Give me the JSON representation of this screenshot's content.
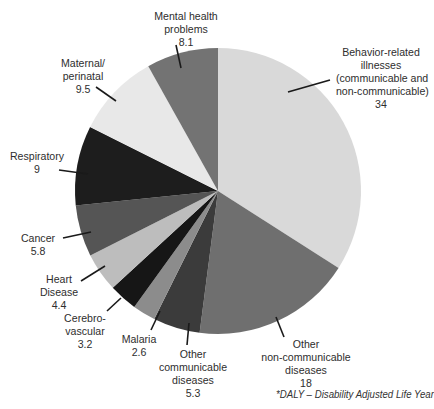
{
  "chart_data": {
    "type": "pie",
    "title": "",
    "unit": "DALY",
    "start_angle_deg": 0,
    "direction": "clockwise",
    "slices": [
      {
        "label": "Behavior-related illnesses (communicable and non-communicable)",
        "value": 34,
        "color": "#d9d9d9"
      },
      {
        "label": "Other non-communicable diseases",
        "value": 18,
        "color": "#6f6f6f"
      },
      {
        "label": "Other communicable diseases",
        "value": 5.3,
        "color": "#3b3b3b"
      },
      {
        "label": "Malaria",
        "value": 2.6,
        "color": "#8c8c8c"
      },
      {
        "label": "Cerebro-vascular",
        "value": 3.2,
        "color": "#161616"
      },
      {
        "label": "Heart Disease",
        "value": 4.4,
        "color": "#bdbdbd"
      },
      {
        "label": "Cancer",
        "value": 5.8,
        "color": "#555555"
      },
      {
        "label": "Respiratory",
        "value": 9,
        "color": "#1d1d1d"
      },
      {
        "label": "Maternal/perinatal",
        "value": 9.5,
        "color": "#e8e8e8"
      },
      {
        "label": "Mental health problems",
        "value": 8.1,
        "color": "#737373"
      }
    ],
    "footnote": "*DALY – Disability Adjusted Life Year"
  },
  "labels": {
    "behavior": {
      "lines": [
        "Behavior-related",
        "illnesses",
        "(communicable and",
        "non-communicable)"
      ],
      "value": "34"
    },
    "other_noncomm": {
      "lines": [
        "Other",
        "non-communicable",
        "diseases"
      ],
      "value": "18"
    },
    "other_comm": {
      "lines": [
        "Other",
        "communicable",
        "diseases"
      ],
      "value": "5.3"
    },
    "malaria": {
      "lines": [
        "Malaria"
      ],
      "value": "2.6"
    },
    "cerebro": {
      "lines": [
        "Cerebro-",
        "vascular"
      ],
      "value": "3.2"
    },
    "heart": {
      "lines": [
        "Heart",
        "Disease"
      ],
      "value": "4.4"
    },
    "cancer": {
      "lines": [
        "Cancer"
      ],
      "value": "5.8"
    },
    "respiratory": {
      "lines": [
        "Respiratory"
      ],
      "value": "9"
    },
    "maternal": {
      "lines": [
        "Maternal/",
        "perinatal"
      ],
      "value": "9.5"
    },
    "mental": {
      "lines": [
        "Mental health",
        "problems"
      ],
      "value": "8.1"
    }
  },
  "footnote": "*DALY – Disability Adjusted Life Year"
}
